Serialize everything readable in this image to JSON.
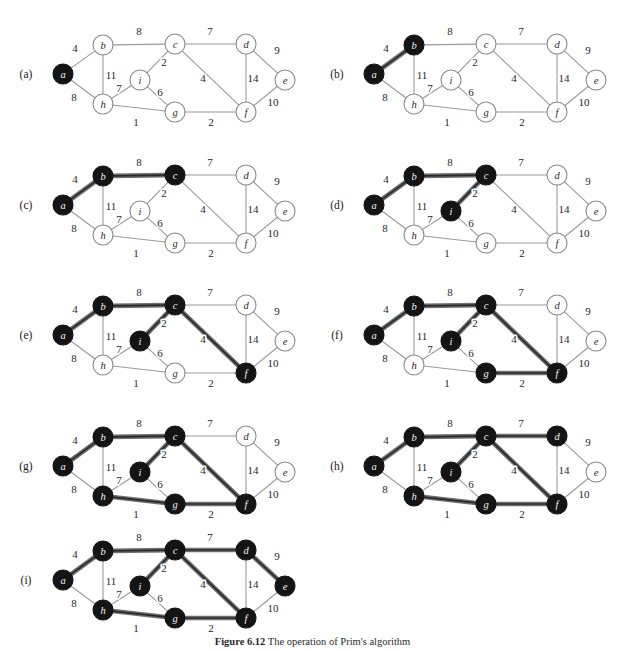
{
  "figure": {
    "caption_prefix": "Figure 6.12",
    "caption_text": "The operation of Prim's algorithm",
    "width": 625,
    "height": 651
  },
  "style": {
    "node_fill_unvisited": "#ffffff",
    "node_fill_visited": "#141414",
    "node_stroke": "#8a8a8a",
    "node_radius": 10,
    "edge_color": "#9a9a9a",
    "edge_width": 1.1,
    "highlight_color": "#6f6f6f",
    "highlight_core": "#2a2a2a",
    "highlight_width": 4.6,
    "label_on_light": "#2b2b2b",
    "label_on_dark": "#f2f2f2"
  },
  "graph": {
    "nodes": [
      {
        "id": "a",
        "label": "a",
        "x": 63,
        "y": 74
      },
      {
        "id": "b",
        "label": "b",
        "x": 103,
        "y": 45
      },
      {
        "id": "h",
        "label": "h",
        "x": 103,
        "y": 104
      },
      {
        "id": "c",
        "label": "c",
        "x": 175,
        "y": 44
      },
      {
        "id": "i",
        "label": "i",
        "x": 140,
        "y": 80
      },
      {
        "id": "g",
        "label": "g",
        "x": 175,
        "y": 112
      },
      {
        "id": "d",
        "label": "d",
        "x": 246,
        "y": 44
      },
      {
        "id": "f",
        "label": "f",
        "x": 246,
        "y": 112
      },
      {
        "id": "e",
        "label": "e",
        "x": 285,
        "y": 80
      }
    ],
    "edges": [
      {
        "id": "a-b",
        "from": "a",
        "to": "b",
        "weight": "4",
        "lx": 75,
        "ly": 52
      },
      {
        "id": "a-h",
        "from": "a",
        "to": "h",
        "weight": "8",
        "lx": 74,
        "ly": 101
      },
      {
        "id": "b-h",
        "from": "b",
        "to": "h",
        "weight": "11",
        "lx": 111,
        "ly": 79
      },
      {
        "id": "b-c",
        "from": "b",
        "to": "c",
        "weight": "8",
        "lx": 139,
        "ly": 35
      },
      {
        "id": "h-i",
        "from": "h",
        "to": "i",
        "weight": "7",
        "lx": 119,
        "ly": 92
      },
      {
        "id": "h-g",
        "from": "h",
        "to": "g",
        "weight": "1",
        "lx": 136,
        "ly": 126
      },
      {
        "id": "c-i",
        "from": "c",
        "to": "i",
        "weight": "2",
        "lx": 164,
        "ly": 66
      },
      {
        "id": "i-g",
        "from": "i",
        "to": "g",
        "weight": "6",
        "lx": 160,
        "ly": 96
      },
      {
        "id": "c-d",
        "from": "c",
        "to": "d",
        "weight": "7",
        "lx": 210,
        "ly": 35
      },
      {
        "id": "c-f",
        "from": "c",
        "to": "f",
        "weight": "4",
        "lx": 203,
        "ly": 82
      },
      {
        "id": "g-f",
        "from": "g",
        "to": "f",
        "weight": "2",
        "lx": 211,
        "ly": 126
      },
      {
        "id": "d-f",
        "from": "d",
        "to": "f",
        "weight": "14",
        "lx": 253,
        "ly": 82
      },
      {
        "id": "d-e",
        "from": "d",
        "to": "e",
        "weight": "9",
        "lx": 277,
        "ly": 54
      },
      {
        "id": "e-f",
        "from": "e",
        "to": "f",
        "weight": "10",
        "lx": 273,
        "ly": 106
      }
    ]
  },
  "panels": [
    {
      "id": "a",
      "label": "(a)",
      "label_x": 26,
      "label_y": 78,
      "origin_x": 0,
      "origin_y": 0,
      "visited": [
        "a"
      ],
      "tree_edges": []
    },
    {
      "id": "b",
      "label": "(b)",
      "label_x": 337,
      "label_y": 78,
      "origin_x": 311,
      "origin_y": 0,
      "visited": [
        "a",
        "b"
      ],
      "tree_edges": [
        "a-b"
      ]
    },
    {
      "id": "c",
      "label": "(c)",
      "label_x": 26,
      "label_y": 209,
      "origin_x": 0,
      "origin_y": 131,
      "visited": [
        "a",
        "b",
        "c"
      ],
      "tree_edges": [
        "a-b",
        "b-c"
      ]
    },
    {
      "id": "d",
      "label": "(d)",
      "label_x": 337,
      "label_y": 209,
      "origin_x": 311,
      "origin_y": 131,
      "visited": [
        "a",
        "b",
        "c",
        "i"
      ],
      "tree_edges": [
        "a-b",
        "b-c",
        "c-i"
      ]
    },
    {
      "id": "e",
      "label": "(e)",
      "label_x": 26,
      "label_y": 339,
      "origin_x": 0,
      "origin_y": 261,
      "visited": [
        "a",
        "b",
        "c",
        "i",
        "f"
      ],
      "tree_edges": [
        "a-b",
        "b-c",
        "c-i",
        "c-f"
      ]
    },
    {
      "id": "f",
      "label": "(f)",
      "label_x": 337,
      "label_y": 339,
      "origin_x": 311,
      "origin_y": 261,
      "visited": [
        "a",
        "b",
        "c",
        "i",
        "f",
        "g"
      ],
      "tree_edges": [
        "a-b",
        "b-c",
        "c-i",
        "c-f",
        "g-f"
      ]
    },
    {
      "id": "g",
      "label": "(g)",
      "label_x": 26,
      "label_y": 470,
      "origin_x": 0,
      "origin_y": 392,
      "visited": [
        "a",
        "b",
        "c",
        "i",
        "f",
        "g",
        "h"
      ],
      "tree_edges": [
        "a-b",
        "b-c",
        "c-i",
        "c-f",
        "g-f",
        "h-g"
      ]
    },
    {
      "id": "h",
      "label": "(h)",
      "label_x": 337,
      "label_y": 470,
      "origin_x": 311,
      "origin_y": 392,
      "visited": [
        "a",
        "b",
        "c",
        "i",
        "f",
        "g",
        "h",
        "d"
      ],
      "tree_edges": [
        "a-b",
        "b-c",
        "c-i",
        "c-f",
        "g-f",
        "h-g",
        "c-d"
      ]
    },
    {
      "id": "i",
      "label": "(i)",
      "label_x": 26,
      "label_y": 584,
      "origin_x": 0,
      "origin_y": 506,
      "visited": [
        "a",
        "b",
        "c",
        "i",
        "f",
        "g",
        "h",
        "d",
        "e"
      ],
      "tree_edges": [
        "a-b",
        "b-c",
        "c-i",
        "c-f",
        "g-f",
        "h-g",
        "c-d",
        "d-e"
      ]
    }
  ]
}
